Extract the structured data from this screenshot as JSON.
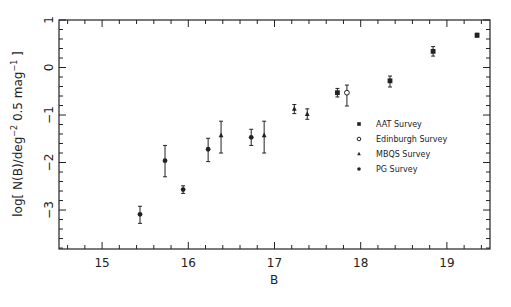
{
  "chart_data": {
    "type": "scatter",
    "title": "",
    "xlabel": "B",
    "ylabel": "log[ N(B)/deg⁻² 0.5 mag⁻¹ ]",
    "xlim": [
      14.5,
      19.5
    ],
    "ylim": [
      -3.82,
      1.0
    ],
    "xticks": [
      15,
      16,
      17,
      18,
      19
    ],
    "yticks": [
      -3,
      -2,
      -1,
      0,
      1
    ],
    "grid": false,
    "legend_position": "right-middle inside",
    "series": [
      {
        "name": "AAT Survey",
        "marker": "filled-square",
        "points": [
          {
            "x": 17.73,
            "y": -0.53,
            "yerr_low": 0.09,
            "yerr_high": 0.09
          },
          {
            "x": 18.34,
            "y": -0.28,
            "yerr_low": 0.13,
            "yerr_high": 0.1
          },
          {
            "x": 18.84,
            "y": 0.34,
            "yerr_low": 0.1,
            "yerr_high": 0.1
          },
          {
            "x": 19.35,
            "y": 0.68,
            "yerr_low": 0.04,
            "yerr_high": 0.04
          }
        ]
      },
      {
        "name": "Edinburgh Survey",
        "marker": "open-circle",
        "points": [
          {
            "x": 17.84,
            "y": -0.53,
            "yerr_low": 0.28,
            "yerr_high": 0.16
          }
        ]
      },
      {
        "name": "MBQS Survey",
        "marker": "filled-triangle",
        "points": [
          {
            "x": 16.38,
            "y": -1.43,
            "yerr_low": 0.37,
            "yerr_high": 0.3
          },
          {
            "x": 16.88,
            "y": -1.43,
            "yerr_low": 0.37,
            "yerr_high": 0.3
          },
          {
            "x": 17.23,
            "y": -0.87,
            "yerr_low": 0.1,
            "yerr_high": 0.09
          },
          {
            "x": 17.38,
            "y": -0.98,
            "yerr_low": 0.11,
            "yerr_high": 0.11
          }
        ]
      },
      {
        "name": "PG Survey",
        "marker": "filled-circle",
        "points": [
          {
            "x": 15.44,
            "y": -3.09,
            "yerr_low": 0.19,
            "yerr_high": 0.17
          },
          {
            "x": 15.73,
            "y": -1.96,
            "yerr_low": 0.34,
            "yerr_high": 0.32
          },
          {
            "x": 15.94,
            "y": -2.57,
            "yerr_low": 0.08,
            "yerr_high": 0.08
          },
          {
            "x": 16.23,
            "y": -1.72,
            "yerr_low": 0.26,
            "yerr_high": 0.23
          },
          {
            "x": 16.73,
            "y": -1.47,
            "yerr_low": 0.17,
            "yerr_high": 0.17
          }
        ]
      }
    ]
  },
  "axes": {
    "x_tick_labels": [
      "15",
      "16",
      "17",
      "18",
      "19"
    ],
    "y_tick_labels": [
      "−3",
      "−2",
      "−1",
      "0",
      "1"
    ],
    "xlabel": "B",
    "ylabel_main": "log[ N(B)/deg",
    "ylabel_sup1": "−2",
    "ylabel_mid": " 0.5 mag",
    "ylabel_sup2": "−1",
    "ylabel_end": " ]"
  },
  "legend": {
    "items": [
      {
        "label": "AAT Survey",
        "marker": "filled-square"
      },
      {
        "label": "Edinburgh Survey",
        "marker": "open-circle"
      },
      {
        "label": "MBQS Survey",
        "marker": "filled-triangle"
      },
      {
        "label": "PG Survey",
        "marker": "filled-circle"
      }
    ]
  },
  "colors": {
    "ink": "#222222",
    "background": "#ffffff"
  }
}
